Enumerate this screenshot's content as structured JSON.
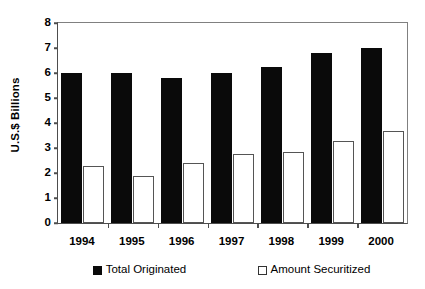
{
  "chart_data": {
    "type": "bar",
    "title": "",
    "subtitle": "",
    "xlabel": "",
    "ylabel": "U.S.$ Billions",
    "categories": [
      "1994",
      "1995",
      "1996",
      "1997",
      "1998",
      "1999",
      "2000"
    ],
    "series": [
      {
        "name": "Total Originated",
        "color": "#0a0a0a",
        "style": "filled",
        "values": [
          6.0,
          6.0,
          5.8,
          6.0,
          6.25,
          6.8,
          7.0
        ]
      },
      {
        "name": "Amount Securitized",
        "color": "#ffffff",
        "style": "outlined",
        "values": [
          2.3,
          1.9,
          2.4,
          2.75,
          2.85,
          3.3,
          3.7
        ]
      }
    ],
    "ylim": [
      0,
      8
    ],
    "ytick_values": [
      0,
      1,
      2,
      3,
      4,
      5,
      6,
      7,
      8
    ],
    "ytick_labels": [
      "0",
      "1",
      "2",
      "3",
      "4",
      "5",
      "6",
      "7",
      "8"
    ],
    "grid": false,
    "legend_position": "bottom"
  },
  "legend": {
    "items": [
      {
        "label": "Total Originated",
        "swatch": "filled-square-icon"
      },
      {
        "label": "Amount Securitized",
        "swatch": "outlined-square-icon"
      }
    ]
  }
}
